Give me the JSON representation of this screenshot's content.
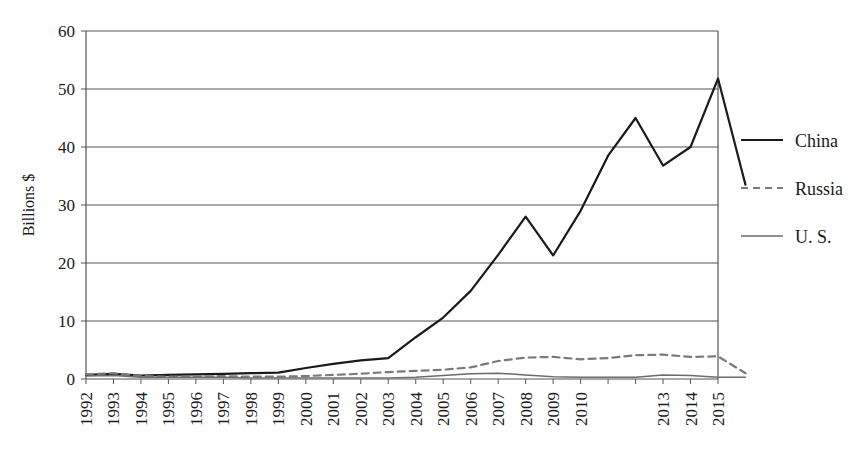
{
  "chart_data": {
    "type": "line",
    "title": "",
    "xlabel": "",
    "ylabel": "Billions $",
    "ylim": [
      0,
      60
    ],
    "yticks": [
      0,
      10,
      20,
      30,
      40,
      50,
      60
    ],
    "grid": true,
    "legend_position": "right",
    "x": [
      1992,
      1993,
      1994,
      1995,
      1996,
      1997,
      1998,
      1999,
      2000,
      2001,
      2002,
      2003,
      2004,
      2005,
      2006,
      2007,
      2008,
      2009,
      2010,
      2011,
      2012,
      2013,
      2014,
      2015
    ],
    "categories": [
      "1992",
      "1993",
      "1994",
      "1995",
      "1996",
      "1997",
      "1998",
      "1999",
      "2000",
      "2001",
      "2002",
      "2003",
      "2004",
      "2005",
      "2006",
      "2007",
      "2008",
      "2009",
      "2010",
      "2011",
      "2012",
      "2013",
      "2014",
      "2015"
    ],
    "xtick_labels": [
      "1992",
      "1993",
      "1994",
      "1995",
      "1996",
      "1997",
      "1998",
      "1999",
      "2000",
      "2001",
      "2002",
      "2003",
      "2004",
      "2005",
      "2006",
      "2007",
      "2008",
      "2009",
      "2010",
      "2013",
      "2014",
      "2015"
    ],
    "series": [
      {
        "name": "China",
        "style": "solid",
        "color": "#1a1a1a",
        "width": 2.2,
        "values": [
          0.7,
          0.9,
          0.6,
          0.7,
          0.8,
          0.9,
          1.0,
          1.1,
          1.9,
          2.6,
          3.2,
          3.6,
          7.2,
          10.6,
          15.2,
          21.4,
          28.0,
          21.3,
          29.0,
          38.5,
          45.0,
          36.8,
          40.0,
          51.8
        ],
        "note": "2015 final value 33.5; series plotted as 24 points 1992-2015"
      },
      {
        "name": "Russia",
        "style": "dashed",
        "color": "#7a7a7a",
        "width": 2.2,
        "values": [
          0.8,
          1.0,
          0.5,
          0.4,
          0.4,
          0.5,
          0.4,
          0.4,
          0.5,
          0.7,
          0.9,
          1.2,
          1.4,
          1.6,
          2.0,
          3.1,
          3.7,
          3.8,
          3.4,
          3.6,
          4.1,
          4.2,
          3.8,
          3.9
        ],
        "note": "2015 final value 1.0"
      },
      {
        "name": "U. S.",
        "style": "solid-thin",
        "color": "#6b6b6b",
        "width": 1.4,
        "values": [
          0.5,
          0.6,
          0.3,
          0.3,
          0.3,
          0.3,
          0.2,
          0.2,
          0.2,
          0.2,
          0.2,
          0.2,
          0.3,
          0.6,
          0.9,
          1.0,
          0.7,
          0.4,
          0.3,
          0.3,
          0.3,
          0.7,
          0.6,
          0.3
        ],
        "note": "stays near zero throughout"
      }
    ],
    "series_full": {
      "China": [
        0.7,
        0.9,
        0.6,
        0.7,
        0.8,
        0.9,
        1.0,
        1.1,
        1.9,
        2.6,
        3.2,
        3.6,
        7.2,
        10.6,
        15.2,
        21.4,
        28.0,
        21.3,
        29.0,
        38.5,
        45.0,
        36.8,
        40.0,
        51.8,
        33.5
      ],
      "Russia": [
        0.8,
        1.0,
        0.5,
        0.4,
        0.4,
        0.5,
        0.4,
        0.4,
        0.5,
        0.7,
        0.9,
        1.2,
        1.4,
        1.6,
        2.0,
        3.1,
        3.7,
        3.8,
        3.4,
        3.6,
        4.1,
        4.2,
        3.8,
        3.9,
        1.0
      ],
      "U. S.": [
        0.5,
        0.6,
        0.3,
        0.3,
        0.3,
        0.3,
        0.2,
        0.2,
        0.2,
        0.2,
        0.2,
        0.2,
        0.3,
        0.6,
        0.9,
        1.0,
        0.7,
        0.4,
        0.3,
        0.3,
        0.3,
        0.7,
        0.6,
        0.3,
        0.3
      ]
    }
  },
  "legend": {
    "items": [
      {
        "label": "China"
      },
      {
        "label": "Russia"
      },
      {
        "label": "U. S."
      }
    ]
  },
  "axes": {
    "y_axis_title": "Billions $",
    "y_tick_labels": [
      "60",
      "50",
      "40",
      "30",
      "20",
      "10",
      "0"
    ]
  },
  "colors": {
    "china": "#1a1a1a",
    "russia": "#7a7a7a",
    "us": "#6b6b6b",
    "grid": "#555555",
    "frame": "#555555",
    "background": "#ffffff"
  }
}
